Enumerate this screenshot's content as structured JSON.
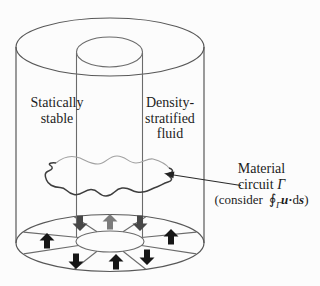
{
  "figure": {
    "type": "annotated-physics-diagram",
    "labels": {
      "statically_stable": {
        "line1": "Statically",
        "line2": "stable"
      },
      "density_stratified": {
        "line1": "Density-",
        "line2": "stratified",
        "line3": "fluid"
      }
    },
    "annotation": {
      "line1": "Material",
      "line2_word": "circuit",
      "line2_symbol": "Γ",
      "line3_open": "(consider",
      "integral": "∮",
      "integral_subscript": "Γ",
      "vector_u": "u",
      "dot_operator": "·",
      "differential": "d",
      "vector_s": "s",
      "line3_close": ")"
    },
    "ring_arrows": [
      {
        "position": "back-left",
        "direction": "down",
        "shade": "dark-gray"
      },
      {
        "position": "back-center",
        "direction": "up",
        "shade": "gray"
      },
      {
        "position": "back-right",
        "direction": "down",
        "shade": "dark-gray"
      },
      {
        "position": "left",
        "direction": "up",
        "shade": "black"
      },
      {
        "position": "right",
        "direction": "up",
        "shade": "black"
      },
      {
        "position": "front-left",
        "direction": "down",
        "shade": "black"
      },
      {
        "position": "front-center",
        "direction": "up",
        "shade": "black"
      },
      {
        "position": "front-right",
        "direction": "down",
        "shade": "black"
      }
    ],
    "colors": {
      "background": "#fcfcfc",
      "line": "#585858",
      "line_light": "#a0a0a0",
      "circuit_front": "#3e3e3e",
      "pointer": "#2a2a2a",
      "text": "#1c1c1c",
      "arrow_black": "#161616",
      "arrow_dark_gray": "#474747",
      "arrow_gray": "#7c7c7c"
    }
  }
}
